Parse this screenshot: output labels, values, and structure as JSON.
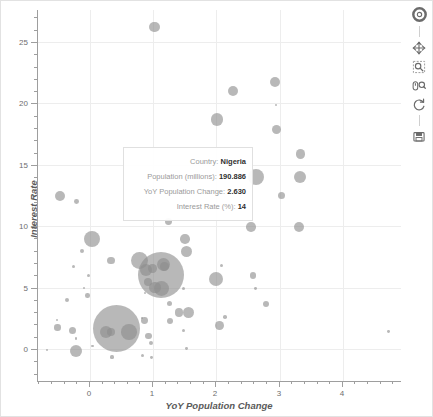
{
  "figure": {
    "background": "#ffffff",
    "border_color": "#e2e2e2",
    "bubble_color": "#8d8d8d",
    "grid_color": "#ededed",
    "axis_color": "#9e9e9e"
  },
  "axes": {
    "x": {
      "label": "YoY Population Change",
      "ticks": [
        "0",
        "1",
        "2",
        "3",
        "4"
      ],
      "range": [
        -0.82,
        4.92
      ]
    },
    "y": {
      "label": "Interest Rate",
      "ticks": [
        "0",
        "5",
        "10",
        "15",
        "20",
        "25"
      ],
      "range": [
        -2.6,
        27.6
      ]
    }
  },
  "tooltip": {
    "rows": [
      {
        "label": "Country:",
        "value": "Nigeria"
      },
      {
        "label": "Population (millions):",
        "value": "190.886"
      },
      {
        "label": "YoY Population Change:",
        "value": "2.630"
      },
      {
        "label": "Interest Rate (%):",
        "value": "14"
      }
    ]
  },
  "toolbar": {
    "items": [
      {
        "name": "bokeh-logo-icon",
        "title": "Bokeh"
      },
      {
        "name": "pan-tool-icon",
        "title": "Pan"
      },
      {
        "name": "box-zoom-tool-icon",
        "title": "Box Zoom"
      },
      {
        "name": "wheel-zoom-tool-icon",
        "title": "Wheel Zoom"
      },
      {
        "name": "reset-tool-icon",
        "title": "Reset"
      },
      {
        "name": "save-tool-icon",
        "title": "Save"
      }
    ]
  },
  "chart_data": {
    "type": "scatter",
    "title": "",
    "xlabel": "YoY Population Change",
    "ylabel": "Interest Rate",
    "xlim": [
      -0.82,
      4.92
    ],
    "ylim": [
      -2.6,
      27.6
    ],
    "grid": true,
    "legend": "none",
    "size_encodes": "Population (millions)",
    "xticks": [
      0,
      1,
      2,
      3,
      4
    ],
    "yticks": [
      0,
      5,
      10,
      15,
      20,
      25
    ],
    "points": [
      {
        "x": 1.02,
        "y": 26.2,
        "r": 5.2
      },
      {
        "x": 2.93,
        "y": 21.7,
        "r": 5.0
      },
      {
        "x": 2.26,
        "y": 21.0,
        "r": 5.0
      },
      {
        "x": 2.01,
        "y": 18.7,
        "r": 6.2
      },
      {
        "x": 2.95,
        "y": 19.9,
        "r": 1.0
      },
      {
        "x": 2.95,
        "y": 17.9,
        "r": 4.6
      },
      {
        "x": 3.33,
        "y": 15.9,
        "r": 4.8
      },
      {
        "x": 2.62,
        "y": 14.0,
        "r": 8.0
      },
      {
        "x": 3.32,
        "y": 14.0,
        "r": 6.2
      },
      {
        "x": 3.03,
        "y": 12.5,
        "r": 3.6
      },
      {
        "x": -0.48,
        "y": 12.5,
        "r": 5.0
      },
      {
        "x": -0.21,
        "y": 12.0,
        "r": 2.4
      },
      {
        "x": 1.24,
        "y": 10.4,
        "r": 3.4
      },
      {
        "x": 2.55,
        "y": 9.95,
        "r": 4.8
      },
      {
        "x": 3.31,
        "y": 9.95,
        "r": 5.0
      },
      {
        "x": 0.03,
        "y": 8.95,
        "r": 8.0
      },
      {
        "x": 1.5,
        "y": 8.95,
        "r": 4.8
      },
      {
        "x": 1.53,
        "y": 7.95,
        "r": 5.6
      },
      {
        "x": -0.13,
        "y": 7.95,
        "r": 2.0
      },
      {
        "x": 0.33,
        "y": 7.2,
        "r": 3.8
      },
      {
        "x": 0.78,
        "y": 7.2,
        "r": 8.4
      },
      {
        "x": 1.17,
        "y": 6.85,
        "r": 6.6
      },
      {
        "x": 1.12,
        "y": 6.0,
        "r": 23.0
      },
      {
        "x": 0.88,
        "y": 6.45,
        "r": 6.0
      },
      {
        "x": -0.26,
        "y": 6.7,
        "r": 1.6
      },
      {
        "x": 1.99,
        "y": 5.72,
        "r": 7.2
      },
      {
        "x": 2.58,
        "y": 6.0,
        "r": 3.4
      },
      {
        "x": 2.08,
        "y": 6.8,
        "r": 1.8
      },
      {
        "x": 1.13,
        "y": 4.95,
        "r": 7.4
      },
      {
        "x": 0.92,
        "y": 5.45,
        "r": 4.2
      },
      {
        "x": -0.02,
        "y": 6.0,
        "r": 1.6
      },
      {
        "x": -0.09,
        "y": 4.95,
        "r": 1.2
      },
      {
        "x": 0.87,
        "y": 4.6,
        "r": 1.0
      },
      {
        "x": -0.04,
        "y": 4.35,
        "r": 2.2
      },
      {
        "x": -0.36,
        "y": 4.0,
        "r": 2.4
      },
      {
        "x": 1.48,
        "y": 4.95,
        "r": 1.6
      },
      {
        "x": 1.26,
        "y": 3.7,
        "r": 2.6
      },
      {
        "x": 2.79,
        "y": 3.7,
        "r": 3.0
      },
      {
        "x": 2.62,
        "y": 4.95,
        "r": 1.4
      },
      {
        "x": 1.41,
        "y": 3.0,
        "r": 4.4
      },
      {
        "x": 1.56,
        "y": 3.0,
        "r": 5.6
      },
      {
        "x": 1.27,
        "y": 2.3,
        "r": 3.2
      },
      {
        "x": 0.42,
        "y": 1.7,
        "r": 23.5
      },
      {
        "x": 0.26,
        "y": 1.4,
        "r": 6.0
      },
      {
        "x": 0.33,
        "y": 1.35,
        "r": 4.0
      },
      {
        "x": 0.62,
        "y": 1.4,
        "r": 7.8
      },
      {
        "x": 0.86,
        "y": 2.35,
        "r": 3.4
      },
      {
        "x": 0.93,
        "y": 1.05,
        "r": 3.2
      },
      {
        "x": 0.97,
        "y": 0.5,
        "r": 2.0
      },
      {
        "x": 0.82,
        "y": 2.55,
        "r": 1.2
      },
      {
        "x": -0.52,
        "y": 2.35,
        "r": 1.2
      },
      {
        "x": -0.51,
        "y": 1.75,
        "r": 3.2
      },
      {
        "x": -0.28,
        "y": 1.5,
        "r": 3.6
      },
      {
        "x": -0.22,
        "y": 0.85,
        "r": 1.4
      },
      {
        "x": 0.04,
        "y": 0.25,
        "r": 1.2
      },
      {
        "x": 2.05,
        "y": 1.95,
        "r": 4.4
      },
      {
        "x": 2.14,
        "y": 2.6,
        "r": 1.8
      },
      {
        "x": 1.48,
        "y": 1.5,
        "r": 1.8
      },
      {
        "x": -0.22,
        "y": -0.15,
        "r": 6.0
      },
      {
        "x": -0.68,
        "y": -0.05,
        "r": 1.0
      },
      {
        "x": 1.53,
        "y": 0.05,
        "r": 1.4
      },
      {
        "x": 0.35,
        "y": -0.65,
        "r": 1.6
      },
      {
        "x": 0.83,
        "y": -0.55,
        "r": 1.6
      },
      {
        "x": 0.97,
        "y": -0.7,
        "r": 1.4
      },
      {
        "x": 4.72,
        "y": 1.45,
        "r": 1.4
      },
      {
        "x": 1.18,
        "y": 6.7,
        "r": 4.6
      },
      {
        "x": 1.03,
        "y": 5.0,
        "r": 5.6
      },
      {
        "x": 0.99,
        "y": 6.55,
        "r": 4.2
      }
    ]
  }
}
